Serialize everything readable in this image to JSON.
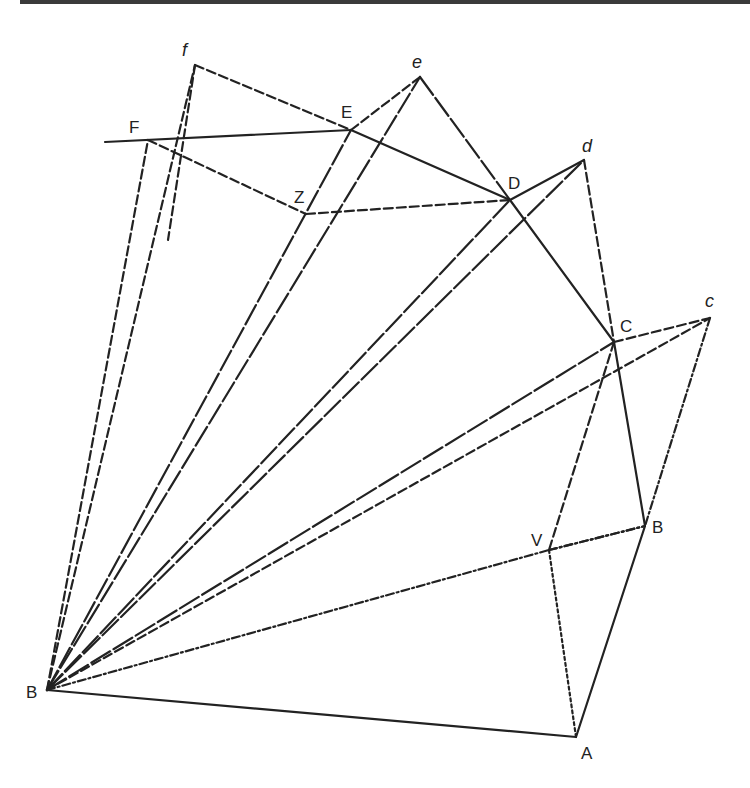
{
  "figure": {
    "type": "geometric construction (unfolded polyhedral net / fan projection)",
    "labels": {
      "f": "f",
      "F": "F",
      "e": "e",
      "E": "E",
      "Z": "Z",
      "D": "D",
      "d": "d",
      "C": "C",
      "c": "c",
      "B_right": "B",
      "V": "V",
      "A": "A",
      "B_apex": "B"
    },
    "points": {
      "f": [
        195,
        65
      ],
      "F": [
        148,
        140
      ],
      "e": [
        420,
        77
      ],
      "E": [
        351,
        130
      ],
      "Z": [
        306,
        214
      ],
      "D": [
        510,
        200
      ],
      "d": [
        584,
        160
      ],
      "C": [
        614,
        342
      ],
      "c": [
        710,
        318
      ],
      "B_right": [
        645,
        526
      ],
      "V": [
        549,
        550
      ],
      "A": [
        576,
        737
      ],
      "B_apex": [
        47,
        690
      ],
      "F_left_end": [
        105,
        142
      ]
    }
  }
}
